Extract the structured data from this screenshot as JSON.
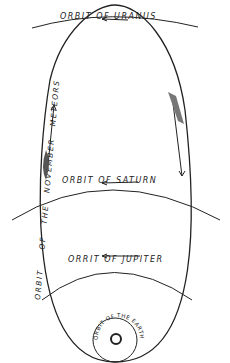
{
  "diagram": {
    "labels": {
      "uranus": "ORBIT  OF  URANUS",
      "saturn": "ORBIT  OF  SATURN",
      "jupiter": "ORRIT  OF  JUPITER",
      "earth": "ORBIT OF THE EARTH",
      "meteors_1": "ORBIT",
      "meteors_2": "OF",
      "meteors_3": "THE",
      "meteors_4": "NOVEMBER",
      "meteors_5": "METEORS"
    },
    "elements": [
      "meteor-orbit-ellipse",
      "uranus-orbit-arc",
      "saturn-orbit-arc",
      "jupiter-orbit-arc",
      "earth-orbit-circle",
      "sun",
      "direction-arrows"
    ],
    "colors": {
      "ink": "#222222",
      "background": "#ffffff"
    }
  }
}
